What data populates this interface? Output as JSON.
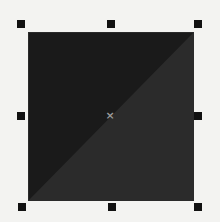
{
  "canvas": {
    "background_color": "#f3f3f1"
  },
  "selected_shape": {
    "type": "rectangle",
    "fill_upper_left": "#1a1a1a",
    "fill_lower_right": "#2b2b2b",
    "selected": true
  },
  "selection_handles": [
    {
      "position": "top-left"
    },
    {
      "position": "top-center"
    },
    {
      "position": "top-right"
    },
    {
      "position": "middle-left"
    },
    {
      "position": "middle-right"
    },
    {
      "position": "bottom-left"
    },
    {
      "position": "bottom-center"
    },
    {
      "position": "bottom-right"
    }
  ],
  "center_marker": {
    "glyph": "×",
    "color": "#9a9a9a"
  }
}
